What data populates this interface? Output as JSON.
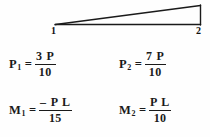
{
  "figure": {
    "type": "structural-beam-wedge-diagram",
    "background_color": "#fefefe",
    "line_color": "#1a1a1a",
    "nodes": [
      {
        "id": "1",
        "label": "1",
        "position": "left-vertex"
      },
      {
        "id": "2",
        "label": "2",
        "position": "right-vertex"
      }
    ],
    "shape_description": "triangular (linearly varying) distributed load wedge over a beam from node 1 to node 2"
  },
  "equations": [
    {
      "id": "p1",
      "lhs_symbol": "P",
      "lhs_subscript": "1",
      "equals": "=",
      "numerator": "3 P",
      "denominator": "10"
    },
    {
      "id": "p2",
      "lhs_symbol": "P",
      "lhs_subscript": "2",
      "equals": "=",
      "numerator": "7 P",
      "denominator": "10"
    },
    {
      "id": "m1",
      "lhs_symbol": "M",
      "lhs_subscript": "1",
      "equals": "=",
      "numerator": "– P L",
      "denominator": "15"
    },
    {
      "id": "m2",
      "lhs_symbol": "M",
      "lhs_subscript": "2",
      "equals": "=",
      "numerator": "P L",
      "denominator": "10"
    }
  ]
}
